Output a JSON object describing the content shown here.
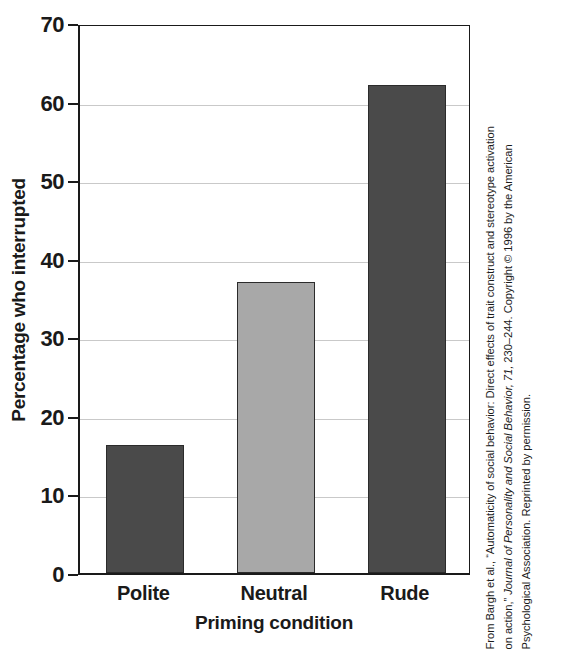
{
  "chart_data": {
    "type": "bar",
    "title": "",
    "categories": [
      "Polite",
      "Neutral",
      "Rude"
    ],
    "values": [
      16.3,
      37.1,
      62.1
    ],
    "series": [
      {
        "name": "Percentage who interrupted",
        "values": [
          16.3,
          37.1,
          62.1
        ]
      }
    ],
    "xlabel": "Priming condition",
    "ylabel": "Percentage who interrupted",
    "ylim": [
      0,
      70
    ],
    "yticks": [
      0,
      10,
      20,
      30,
      40,
      50,
      60,
      70
    ],
    "ytick_labels": [
      "0",
      "10",
      "20",
      "30",
      "40",
      "50",
      "60",
      "70"
    ],
    "grid": true,
    "legend": false,
    "bar_colors": [
      "#4a4a4a",
      "#a8a8a8",
      "#4a4a4a"
    ],
    "bar_edge_color": "#2b2b2b"
  },
  "axes": {
    "y_title": "Percentage who interrupted",
    "x_title": "Priming condition",
    "y_ticks": [
      {
        "value": 70,
        "label": "70"
      },
      {
        "value": 60,
        "label": "60"
      },
      {
        "value": 50,
        "label": "50"
      },
      {
        "value": 40,
        "label": "40"
      },
      {
        "value": 30,
        "label": "30"
      },
      {
        "value": 20,
        "label": "20"
      },
      {
        "value": 10,
        "label": "10"
      },
      {
        "value": 0,
        "label": "0"
      }
    ],
    "x_ticks": [
      {
        "label": "Polite"
      },
      {
        "label": "Neutral"
      },
      {
        "label": "Rude"
      }
    ]
  },
  "caption": {
    "lines": [
      "From Bargh et al., “Automaticity of social behavior: Direct effects of trait construct and stereotype activation",
      "on action,” Journal of Personality and Social Behavior, 71, 230–244. Copyright © 1996 by the American",
      "Psychological Association. Reprinted by permission."
    ],
    "line1_plain": "From Bargh et al., “Automaticity of social behavior: Direct effects of trait construct and stereotype activation",
    "line2_pre": "on action,” ",
    "line2_italic": "Journal of Personality and Social Behavior, 71,",
    "line2_post": " 230–244. Copyright © 1996 by the American",
    "line3_plain": "Psychological Association. Reprinted by permission."
  },
  "colors": {
    "bar_dark": "#4a4a4a",
    "bar_light": "#a8a8a8",
    "axis": "#1a1a1a",
    "grid": "#c9c9c9",
    "background": "#ffffff"
  }
}
